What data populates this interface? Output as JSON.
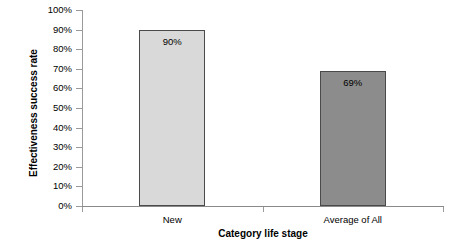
{
  "chart_data": {
    "type": "bar",
    "title": "",
    "xlabel": "Category life stage",
    "ylabel": "Effectiveness success rate",
    "categories": [
      "New",
      "Average of All"
    ],
    "values": [
      90,
      69
    ],
    "value_labels": [
      "90%",
      "69%"
    ],
    "ylim": [
      0,
      100
    ],
    "ytick_labels": [
      "100%",
      "90%",
      "80%",
      "70%",
      "60%",
      "50%",
      "40%",
      "30%",
      "20%",
      "10%",
      "0%"
    ],
    "ytick_values": [
      100,
      90,
      80,
      70,
      60,
      50,
      40,
      30,
      20,
      10,
      0
    ],
    "grid": false,
    "legend": "none",
    "bar_colors": [
      "#d9d9d9",
      "#8c8c8c"
    ],
    "bar_border_color": "#4a4a4a",
    "axis_color": "#9a9a9a",
    "background": "#ffffff",
    "series": [
      {
        "name": "Effectiveness success rate",
        "points": [
          {
            "category": "New",
            "value": 90,
            "label": "90%",
            "color": "#d9d9d9"
          },
          {
            "category": "Average of All",
            "value": 69,
            "label": "69%",
            "color": "#8c8c8c"
          }
        ]
      }
    ]
  }
}
